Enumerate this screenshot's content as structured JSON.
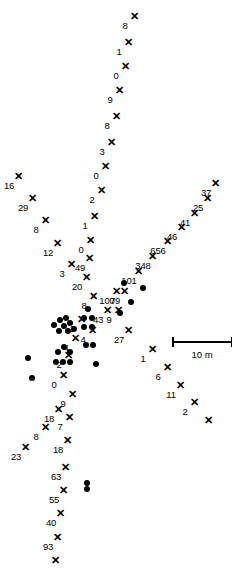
{
  "figure": {
    "type": "scatter-map",
    "background": "#ffffff",
    "ink_color": "#000000",
    "width": 245,
    "height": 588
  },
  "scalebar": {
    "label": "10 m",
    "x": 172,
    "y": 341,
    "length": 60
  },
  "chart_data": {
    "type": "scatter",
    "title": "",
    "xlabel": "",
    "ylabel": "",
    "grid": false,
    "legend": "none",
    "units": "m",
    "scalebar_label": "10 m",
    "scalebar_length_px": 60,
    "series": [
      {
        "name": "marked-points",
        "marker": "x",
        "points": [
          {
            "x": 134,
            "y": 16,
            "label": "8"
          },
          {
            "x": 128,
            "y": 42,
            "label": "1"
          },
          {
            "x": 125,
            "y": 66,
            "label": "0"
          },
          {
            "x": 119,
            "y": 90,
            "label": "9"
          },
          {
            "x": 116,
            "y": 116,
            "label": "8"
          },
          {
            "x": 111,
            "y": 142,
            "label": "3"
          },
          {
            "x": 105,
            "y": 166,
            "label": "0"
          },
          {
            "x": 101,
            "y": 190,
            "label": "2"
          },
          {
            "x": 94,
            "y": 216,
            "label": "1"
          },
          {
            "x": 90,
            "y": 240,
            "label": "0"
          },
          {
            "x": 89,
            "y": 258,
            "label": "49"
          },
          {
            "x": 86,
            "y": 277,
            "label": "20"
          },
          {
            "x": 18,
            "y": 176,
            "label": "16"
          },
          {
            "x": 32,
            "y": 198,
            "label": "29"
          },
          {
            "x": 45,
            "y": 220,
            "label": "8"
          },
          {
            "x": 57,
            "y": 243,
            "label": "12"
          },
          {
            "x": 71,
            "y": 264,
            "label": "3"
          },
          {
            "x": 215,
            "y": 183,
            "label": "37"
          },
          {
            "x": 207,
            "y": 198,
            "label": "25"
          },
          {
            "x": 194,
            "y": 213,
            "label": "41"
          },
          {
            "x": 181,
            "y": 227,
            "label": "46"
          },
          {
            "x": 167,
            "y": 241,
            "label": "656"
          },
          {
            "x": 152,
            "y": 256,
            "label": "348"
          },
          {
            "x": 138,
            "y": 271,
            "label": "101"
          },
          {
            "x": 116,
            "y": 291,
            "label": "100"
          },
          {
            "x": 124,
            "y": 291,
            "label": "79"
          },
          {
            "x": 107,
            "y": 310,
            "label": "43"
          },
          {
            "x": 118,
            "y": 310,
            "label": "9"
          },
          {
            "x": 128,
            "y": 330,
            "label": "27"
          },
          {
            "x": 152,
            "y": 349,
            "label": "1"
          },
          {
            "x": 167,
            "y": 367,
            "label": "6"
          },
          {
            "x": 180,
            "y": 385,
            "label": "11"
          },
          {
            "x": 194,
            "y": 402,
            "label": "2"
          },
          {
            "x": 208,
            "y": 420,
            "label": ""
          },
          {
            "x": 93,
            "y": 296,
            "label": "8"
          },
          {
            "x": 81,
            "y": 319,
            "label": "1"
          },
          {
            "x": 75,
            "y": 338,
            "label": "4"
          },
          {
            "x": 92,
            "y": 330,
            "label": "4"
          },
          {
            "x": 68,
            "y": 355,
            "label": "2"
          },
          {
            "x": 63,
            "y": 375,
            "label": "0"
          },
          {
            "x": 72,
            "y": 394,
            "label": "9"
          },
          {
            "x": 58,
            "y": 409,
            "label": "18"
          },
          {
            "x": 69,
            "y": 417,
            "label": "7"
          },
          {
            "x": 45,
            "y": 427,
            "label": "8"
          },
          {
            "x": 67,
            "y": 440,
            "label": "18"
          },
          {
            "x": 25,
            "y": 447,
            "label": "23"
          },
          {
            "x": 65,
            "y": 467,
            "label": "63"
          },
          {
            "x": 63,
            "y": 490,
            "label": "55"
          },
          {
            "x": 60,
            "y": 513,
            "label": "40"
          },
          {
            "x": 57,
            "y": 537,
            "label": "93"
          },
          {
            "x": 55,
            "y": 560,
            "label": ""
          }
        ]
      },
      {
        "name": "nest-dots",
        "marker": "filled-circle",
        "points": [
          {
            "x": 54,
            "y": 325
          },
          {
            "x": 60,
            "y": 320
          },
          {
            "x": 64,
            "y": 326
          },
          {
            "x": 59,
            "y": 331
          },
          {
            "x": 66,
            "y": 318
          },
          {
            "x": 70,
            "y": 323
          },
          {
            "x": 68,
            "y": 331
          },
          {
            "x": 74,
            "y": 329
          },
          {
            "x": 84,
            "y": 318
          },
          {
            "x": 92,
            "y": 318
          },
          {
            "x": 84,
            "y": 327
          },
          {
            "x": 92,
            "y": 327
          },
          {
            "x": 88,
            "y": 309
          },
          {
            "x": 86,
            "y": 345
          },
          {
            "x": 93,
            "y": 345
          },
          {
            "x": 28,
            "y": 358
          },
          {
            "x": 32,
            "y": 378
          },
          {
            "x": 58,
            "y": 352
          },
          {
            "x": 64,
            "y": 347
          },
          {
            "x": 70,
            "y": 352
          },
          {
            "x": 56,
            "y": 362
          },
          {
            "x": 63,
            "y": 362
          },
          {
            "x": 70,
            "y": 362
          },
          {
            "x": 96,
            "y": 364
          },
          {
            "x": 124,
            "y": 283
          },
          {
            "x": 143,
            "y": 288
          },
          {
            "x": 131,
            "y": 302
          },
          {
            "x": 120,
            "y": 313
          },
          {
            "x": 87,
            "y": 483
          },
          {
            "x": 87,
            "y": 489
          }
        ]
      }
    ]
  }
}
